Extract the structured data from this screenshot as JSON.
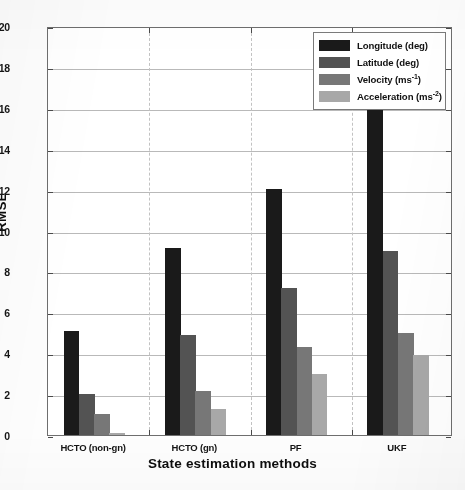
{
  "chart_data": {
    "type": "bar",
    "title": "",
    "xlabel": "State estimation methods",
    "ylabel": "RMSE",
    "categories": [
      "HCTO (non-gn)",
      "HCTO (gn)",
      "PF",
      "UKF"
    ],
    "series": [
      {
        "name": "Longitude (deg)",
        "values": [
          5.1,
          9.15,
          12.05,
          16.0
        ],
        "color": "#1a1a1a"
      },
      {
        "name": "Latitude (deg)",
        "values": [
          2.0,
          4.9,
          7.2,
          9.0
        ],
        "color": "#535353"
      },
      {
        "name": "Velocity (ms-1)",
        "values": [
          1.05,
          2.15,
          4.3,
          5.0
        ],
        "color": "#777777"
      },
      {
        "name": "Acceleration (ms-2)",
        "values": [
          0.12,
          1.25,
          3.0,
          3.9
        ],
        "color": "#a8a8a8"
      }
    ],
    "ylim": [
      0,
      20
    ],
    "ytick_step": 2,
    "yticks": [
      "0",
      "2",
      "4",
      "6",
      "8",
      "10",
      "12",
      "14",
      "16",
      "18",
      "20"
    ],
    "grid": true,
    "grid_horizontal": true,
    "grid_vertical_dashed": true,
    "legend_position": "top-right",
    "legend": [
      {
        "label_base": "Longitude (deg)",
        "label_main": "Longitude (deg)",
        "sup": ""
      },
      {
        "label_base": "Latitude (deg)",
        "label_main": "Latitude (deg)",
        "sup": ""
      },
      {
        "label_base": "Velocity (ms-1)",
        "label_main": "Velocity (ms",
        "sup": "-1",
        "label_tail": ")"
      },
      {
        "label_base": "Acceleration (ms-2)",
        "label_main": "Acceleration (ms",
        "sup": "-2",
        "label_tail": ")"
      }
    ]
  },
  "axes": {
    "y_title": "RMSE",
    "x_title": "State estimation methods"
  },
  "colors": {
    "series_1": "#1a1a1a",
    "series_2": "#535353",
    "series_3": "#777777",
    "series_4": "#a8a8a8",
    "grid": "#b9b9b9",
    "frame": "#6e6e6e",
    "background": "#ffffff"
  }
}
